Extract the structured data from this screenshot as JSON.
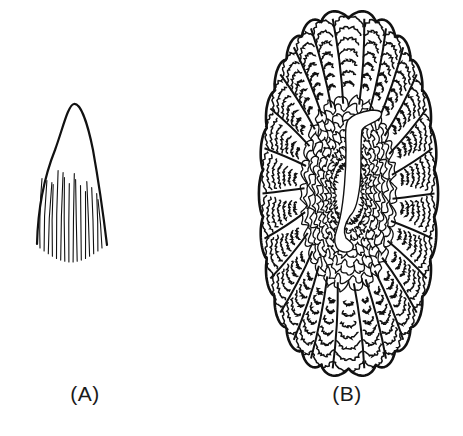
{
  "figure": {
    "panels": [
      {
        "id": "A",
        "label": "(A)",
        "description": "tapered cone-shaped structure, smooth apex, striated base",
        "bbox": [
          35,
          103,
          108,
          263
        ],
        "stroke_color": "#111111",
        "striation_count": 16
      },
      {
        "id": "B",
        "label": "(B)",
        "description": "oval lobed cross-section with densely folded concentric lamellae and central cavity",
        "bbox": [
          260,
          13,
          437,
          374
        ],
        "stroke_color": "#111111",
        "lobes": {
          "top": 5,
          "left_side": 8,
          "right_side": 8,
          "bottom": 5
        },
        "inner_rings": 7
      }
    ],
    "background": "#ffffff",
    "ink": "#111111"
  }
}
